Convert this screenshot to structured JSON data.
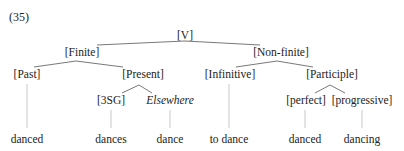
{
  "example_number": "(35)",
  "tree": {
    "root": {
      "label": "[V]",
      "x": 185,
      "y": 29
    },
    "level1": [
      {
        "id": "finite",
        "label": "[Finite]",
        "x": 82,
        "y": 46
      },
      {
        "id": "nonfinite",
        "label": "[Non-finite]",
        "x": 281,
        "y": 46
      }
    ],
    "level2": [
      {
        "id": "past",
        "label": "[Past]",
        "x": 27,
        "y": 68,
        "parent": "finite"
      },
      {
        "id": "present",
        "label": "[Present]",
        "x": 143,
        "y": 68,
        "parent": "finite"
      },
      {
        "id": "infinitive",
        "label": "[Infinitive]",
        "x": 230,
        "y": 68,
        "parent": "nonfinite"
      },
      {
        "id": "participle",
        "label": "[Participle]",
        "x": 332,
        "y": 68,
        "parent": "nonfinite"
      }
    ],
    "level3": [
      {
        "id": "3sg",
        "label": "[3SG]",
        "x": 111,
        "y": 94,
        "parent": "present",
        "italic": false
      },
      {
        "id": "elsewhere",
        "label": "Elsewhere",
        "x": 170,
        "y": 94,
        "parent": "present",
        "italic": true
      },
      {
        "id": "perfect",
        "label": "[perfect]",
        "x": 306,
        "y": 94,
        "parent": "participle",
        "italic": false
      },
      {
        "id": "progressive",
        "label": "[progressive]",
        "x": 362,
        "y": 94,
        "parent": "participle",
        "italic": false
      }
    ],
    "leaves": [
      {
        "label": "danced",
        "x": 27,
        "parent": "past"
      },
      {
        "label": "dances",
        "x": 111,
        "parent": "3sg"
      },
      {
        "label": "dance",
        "x": 170,
        "parent": "elsewhere"
      },
      {
        "label": "to dance",
        "x": 229,
        "parent": "infinitive"
      },
      {
        "label": "danced",
        "x": 305,
        "parent": "perfect"
      },
      {
        "label": "dancing",
        "x": 362,
        "parent": "progressive"
      }
    ]
  },
  "colors": {
    "text": "#222222",
    "branch": "#555555",
    "leaf_line": "#bbbbbb"
  }
}
